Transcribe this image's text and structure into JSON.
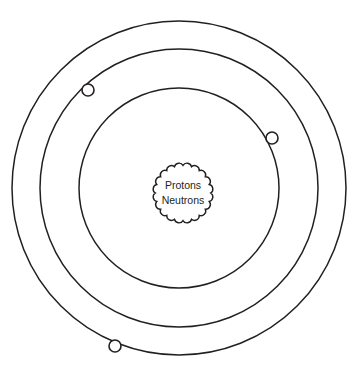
{
  "figure": {
    "type": "diagram",
    "background_color": "#ffffff",
    "stroke_color": "#231f20",
    "width": 357,
    "height": 373
  },
  "nucleus": {
    "name": "nucleus",
    "shape": "scalloped-circle",
    "center_x": 183,
    "center_y": 193,
    "radius": 31,
    "scallop_count": 20,
    "scallop_depth": 3.4,
    "fill_color": "#ffffff",
    "stroke_color": "#231f20",
    "label_line_1": "Protons",
    "label_line_2": "Neutrons"
  },
  "orbits": [
    {
      "name": "inner-orbit",
      "shell_index": 1,
      "center_x": 179,
      "center_y": 188,
      "radius": 100,
      "stroke_color": "#231f20",
      "stroke_width": 1.5
    },
    {
      "name": "middle-orbit",
      "shell_index": 2,
      "center_x": 179,
      "center_y": 188,
      "radius": 139,
      "stroke_color": "#231f20",
      "stroke_width": 1.5
    },
    {
      "name": "outer-orbit",
      "shell_index": 3,
      "center_x": 179,
      "center_y": 188,
      "radius": 167,
      "stroke_color": "#231f20",
      "stroke_width": 1.5
    }
  ],
  "electrons": [
    {
      "name": "electron-upper-left",
      "on_orbit": "middle-orbit",
      "center_x": 88,
      "center_y": 90,
      "radius": 6,
      "fill_color": "#ffffff",
      "stroke_color": "#231f20"
    },
    {
      "name": "electron-right",
      "on_orbit": "inner-orbit",
      "center_x": 272,
      "center_y": 138,
      "radius": 6,
      "fill_color": "#ffffff",
      "stroke_color": "#231f20"
    },
    {
      "name": "electron-bottom-left",
      "on_orbit": "outer-orbit",
      "center_x": 115,
      "center_y": 346,
      "radius": 6,
      "fill_color": "#ffffff",
      "stroke_color": "#231f20"
    }
  ]
}
